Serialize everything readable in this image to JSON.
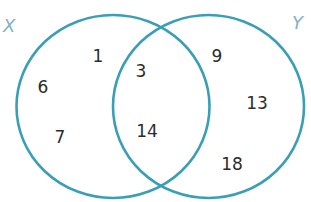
{
  "diagram": {
    "type": "venn",
    "sets": [
      {
        "id": "X",
        "label": "X",
        "elements_only": [
          "1",
          "6",
          "7"
        ]
      },
      {
        "id": "Y",
        "label": "Y",
        "elements_only": [
          "9",
          "13",
          "18"
        ]
      }
    ],
    "intersection": {
      "sets": [
        "X",
        "Y"
      ],
      "elements": [
        "3",
        "14"
      ]
    },
    "colors": {
      "circle_stroke": "#3a9fb5",
      "set_label": "#7fb3c7",
      "element_text": "#2b2b2b",
      "background": "#ffffff"
    }
  },
  "labels": {
    "x": "X",
    "y": "Y"
  },
  "regions": {
    "x_only": [
      "1",
      "6",
      "7"
    ],
    "intersection": [
      "3",
      "14"
    ],
    "y_only": [
      "9",
      "13",
      "18"
    ]
  }
}
